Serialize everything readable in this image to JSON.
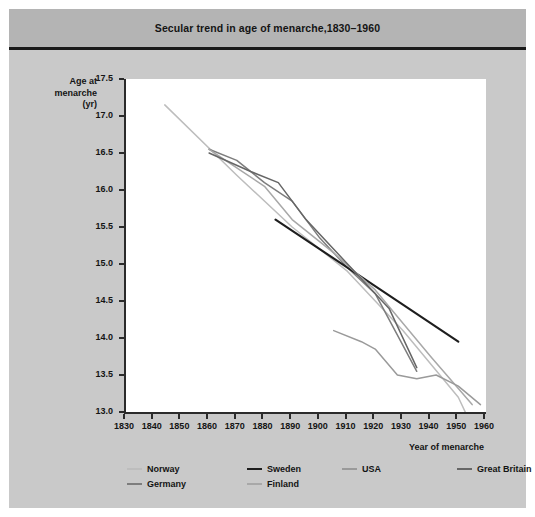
{
  "figure": {
    "title": "Secular trend in age of menarche,1830–1960"
  },
  "axes": {
    "y_title_line1": "Age at",
    "y_title_line2": "menarche",
    "y_title_line3": "(yr)",
    "x_title": "Year of menarche",
    "y_ticks": [
      "17.5",
      "17.0",
      "16.5",
      "16.0",
      "15.5",
      "15.0",
      "14.5",
      "14.0",
      "13.5",
      "13.0"
    ],
    "x_ticks": [
      "1830",
      "1840",
      "1850",
      "1860",
      "1870",
      "1880",
      "1890",
      "1900",
      "1910",
      "1920",
      "1930",
      "1940",
      "1950",
      "1960"
    ]
  },
  "legend": {
    "row1": [
      {
        "label": "Norway",
        "color": "#bdbdbd"
      },
      {
        "label": "Sweden",
        "color": "#1e1e1e"
      },
      {
        "label": "USA",
        "color": "#9a9a9a"
      },
      {
        "label": "Great Britain",
        "color": "#666666"
      }
    ],
    "row2": [
      {
        "label": "Germany",
        "color": "#7d7d7d"
      },
      {
        "label": "Finland",
        "color": "#a8a8a8"
      }
    ]
  },
  "chart_data": {
    "type": "line",
    "title": "Secular trend in age of menarche,1830–1960",
    "xlabel": "Year of menarche",
    "ylabel": "Age at menarche (yr)",
    "xlim": [
      1830,
      1960
    ],
    "ylim": [
      13.0,
      17.5
    ],
    "ytick_step": 0.5,
    "xtick_step": 10,
    "grid": false,
    "legend_position": "bottom",
    "series": [
      {
        "name": "Norway",
        "color": "#bdbdbd",
        "points": [
          {
            "x": 1844,
            "y": 17.15
          },
          {
            "x": 1870,
            "y": 16.2
          },
          {
            "x": 1890,
            "y": 15.5
          },
          {
            "x": 1910,
            "y": 14.9
          },
          {
            "x": 1930,
            "y": 14.1
          },
          {
            "x": 1950,
            "y": 13.2
          },
          {
            "x": 1955,
            "y": 12.8
          }
        ]
      },
      {
        "name": "Germany",
        "color": "#7d7d7d",
        "points": [
          {
            "x": 1860,
            "y": 16.55
          },
          {
            "x": 1870,
            "y": 16.4
          },
          {
            "x": 1880,
            "y": 16.1
          },
          {
            "x": 1890,
            "y": 15.85
          },
          {
            "x": 1900,
            "y": 15.35
          },
          {
            "x": 1910,
            "y": 14.95
          },
          {
            "x": 1920,
            "y": 14.6
          },
          {
            "x": 1930,
            "y": 13.9
          },
          {
            "x": 1935,
            "y": 13.55
          }
        ]
      },
      {
        "name": "Sweden",
        "color": "#1e1e1e",
        "points": [
          {
            "x": 1884,
            "y": 15.6
          },
          {
            "x": 1950,
            "y": 13.95
          }
        ]
      },
      {
        "name": "Finland",
        "color": "#a8a8a8",
        "points": [
          {
            "x": 1860,
            "y": 16.55
          },
          {
            "x": 1870,
            "y": 16.3
          },
          {
            "x": 1880,
            "y": 16.05
          },
          {
            "x": 1890,
            "y": 15.6
          },
          {
            "x": 1905,
            "y": 15.15
          },
          {
            "x": 1920,
            "y": 14.65
          },
          {
            "x": 1940,
            "y": 13.75
          },
          {
            "x": 1955,
            "y": 13.1
          }
        ]
      },
      {
        "name": "USA",
        "color": "#9a9a9a",
        "points": [
          {
            "x": 1905,
            "y": 14.1
          },
          {
            "x": 1915,
            "y": 13.95
          },
          {
            "x": 1920,
            "y": 13.85
          },
          {
            "x": 1928,
            "y": 13.5
          },
          {
            "x": 1935,
            "y": 13.45
          },
          {
            "x": 1942,
            "y": 13.5
          },
          {
            "x": 1950,
            "y": 13.35
          },
          {
            "x": 1958,
            "y": 13.1
          }
        ]
      },
      {
        "name": "Great Britain",
        "color": "#666666",
        "points": [
          {
            "x": 1860,
            "y": 16.5
          },
          {
            "x": 1875,
            "y": 16.25
          },
          {
            "x": 1885,
            "y": 16.1
          },
          {
            "x": 1895,
            "y": 15.6
          },
          {
            "x": 1910,
            "y": 15.0
          },
          {
            "x": 1925,
            "y": 14.4
          },
          {
            "x": 1935,
            "y": 13.6
          }
        ]
      }
    ]
  }
}
